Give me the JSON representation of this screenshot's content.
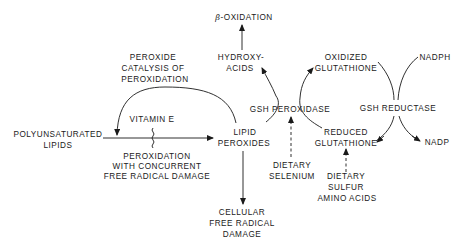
{
  "diagram": {
    "title": "",
    "nodes": {
      "beta_oxidation": {
        "prefix": "β",
        "text": "-OXIDATION"
      },
      "hydroxy_acids": {
        "line1": "HYDROXY-",
        "line2": "ACIDS"
      },
      "peroxide_catalysis": {
        "line1": "PEROXIDE",
        "line2": "CATALYSIS OF",
        "line3": "PEROXIDATION"
      },
      "vitamin_e": {
        "text": "VITAMIN E"
      },
      "polyunsaturated_lipids": {
        "line1": "POLYUNSATURATED",
        "line2": "LIPIDS"
      },
      "peroxidation_damage": {
        "line1": "PEROXIDATION",
        "line2": "WITH CONCURRENT",
        "line3": "FREE RADICAL DAMAGE"
      },
      "lipid_peroxides": {
        "line1": "LIPID",
        "line2": "PEROXIDES"
      },
      "cellular_damage": {
        "line1": "CELLULAR",
        "line2": "FREE RADICAL",
        "line3": "DAMAGE"
      },
      "gsh_peroxidase": {
        "text": "GSH PEROXIDASE"
      },
      "dietary_selenium": {
        "line1": "DIETARY",
        "line2": "SELENIUM"
      },
      "oxidized_glutathione": {
        "line1": "OXIDIZED",
        "line2": "GLUTATHIONE"
      },
      "gsh_reductase": {
        "text": "GSH REDUCTASE"
      },
      "reduced_glutathione": {
        "line1": "REDUCED",
        "line2": "GLUTATHIONE"
      },
      "dietary_sulfur": {
        "line1": "DIETARY",
        "line2": "SULFUR",
        "line3": "AMINO ACIDS"
      },
      "nadph": {
        "text": "NADPH"
      },
      "nadp": {
        "text": "NADP"
      }
    },
    "edges": [
      {
        "from": "POLYUNSATURATED LIPIDS",
        "to": "LIPID PEROXIDES",
        "style": "solid",
        "label": "PEROXIDATION WITH CONCURRENT FREE RADICAL DAMAGE",
        "inhibited_by": "VITAMIN E"
      },
      {
        "from": "LIPID PEROXIDES",
        "to": "PEROXIDATION line",
        "style": "solid-arc",
        "label": "PEROXIDE CATALYSIS OF PEROXIDATION"
      },
      {
        "from": "LIPID PEROXIDES",
        "to": "CELLULAR FREE RADICAL DAMAGE",
        "style": "solid"
      },
      {
        "from": "LIPID PEROXIDES",
        "to": "HYDROXY-ACIDS",
        "style": "solid-curve",
        "via": "GSH PEROXIDASE"
      },
      {
        "from": "HYDROXY-ACIDS",
        "to": "β-OXIDATION",
        "style": "solid"
      },
      {
        "from": "REDUCED GLUTATHIONE",
        "to": "OXIDIZED GLUTATHIONE",
        "style": "solid-curve",
        "via": "GSH PEROXIDASE"
      },
      {
        "from": "DIETARY SELENIUM",
        "to": "GSH PEROXIDASE",
        "style": "dashed"
      },
      {
        "from": "OXIDIZED GLUTATHIONE",
        "to": "REDUCED GLUTATHIONE",
        "style": "solid-curve",
        "via": "GSH REDUCTASE"
      },
      {
        "from": "NADPH",
        "to": "NADP",
        "style": "solid-curve",
        "via": "GSH REDUCTASE"
      },
      {
        "from": "DIETARY SULFUR AMINO ACIDS",
        "to": "REDUCED GLUTATHIONE",
        "style": "dashed"
      }
    ],
    "colors": {
      "ink": "#1a1a1a",
      "background": "#ffffff"
    }
  }
}
